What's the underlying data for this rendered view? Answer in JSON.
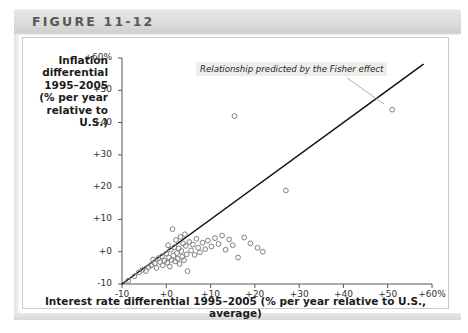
{
  "figure": {
    "label": "FIGURE 11-12"
  },
  "axis": {
    "y_title_lines": [
      "Inflation",
      "differential",
      "1995–2005",
      "(% per year",
      "relative to",
      "U.S.)"
    ],
    "y_title_text": "Inflation differential 1995–2005 (% per year relative to U.S.)",
    "x_title": "Interest rate differential 1995–2005 (% per year relative to U.S., average)"
  },
  "annotation": {
    "text": "Relationship predicted by the Fisher effect"
  },
  "colors": {
    "header_band": "#dcdcda",
    "panel_border": "#c9c9c7",
    "axis": "#555555",
    "line": "#111111",
    "marker_stroke": "#808080",
    "annotation_bg": "#ededeb",
    "text": "#1b1b1b"
  },
  "chart_data": {
    "type": "scatter",
    "title": "",
    "xlabel": "Interest rate differential 1995–2005 (% per year relative to U.S., average)",
    "ylabel": "Inflation differential 1995–2005 (% per year relative to U.S.)",
    "xlim": [
      -10,
      60
    ],
    "ylim": [
      -10,
      60
    ],
    "xticks": [
      -10,
      0,
      10,
      20,
      30,
      40,
      50,
      60
    ],
    "yticks": [
      -10,
      0,
      10,
      20,
      30,
      40,
      50,
      60
    ],
    "xtick_labels": [
      "-10",
      "+0",
      "+10",
      "+20",
      "+30",
      "+40",
      "+50",
      "+60%"
    ],
    "ytick_labels": [
      "-10",
      "+0",
      "+10",
      "+20",
      "+30",
      "+40",
      "+50",
      "+60%"
    ],
    "grid": false,
    "legend": null,
    "annotations": [
      {
        "text": "Relationship predicted by the Fisher effect",
        "x": -4,
        "y": 53,
        "leader_to_x": 18,
        "leader_to_y": 27
      }
    ],
    "series": [
      {
        "name": "Countries",
        "marker": "open-circle",
        "points": [
          [
            -8.6,
            -9.0
          ],
          [
            -7.2,
            -7.6
          ],
          [
            -6.2,
            -6.4
          ],
          [
            -5.4,
            -5.6
          ],
          [
            -4.6,
            -6.0
          ],
          [
            -4.0,
            -4.8
          ],
          [
            -3.4,
            -4.2
          ],
          [
            -3.0,
            -2.4
          ],
          [
            -2.6,
            -3.6
          ],
          [
            -2.2,
            -5.0
          ],
          [
            -1.8,
            -2.0
          ],
          [
            -1.4,
            -3.2
          ],
          [
            -1.0,
            -1.4
          ],
          [
            -0.8,
            -4.2
          ],
          [
            -0.4,
            -2.8
          ],
          [
            0.0,
            -0.6
          ],
          [
            0.2,
            -3.4
          ],
          [
            0.4,
            2.0
          ],
          [
            0.6,
            -1.8
          ],
          [
            0.8,
            -4.6
          ],
          [
            1.0,
            0.6
          ],
          [
            1.2,
            -2.6
          ],
          [
            1.4,
            7.0
          ],
          [
            1.6,
            -1.2
          ],
          [
            1.8,
            1.4
          ],
          [
            2.0,
            -3.0
          ],
          [
            2.2,
            3.6
          ],
          [
            2.4,
            -0.4
          ],
          [
            2.6,
            -2.2
          ],
          [
            2.8,
            1.0
          ],
          [
            3.0,
            -3.8
          ],
          [
            3.2,
            4.6
          ],
          [
            3.4,
            0.2
          ],
          [
            3.6,
            -1.6
          ],
          [
            3.8,
            2.6
          ],
          [
            4.0,
            -2.6
          ],
          [
            4.2,
            5.4
          ],
          [
            4.4,
            1.8
          ],
          [
            4.6,
            -0.8
          ],
          [
            4.8,
            -6.0
          ],
          [
            5.2,
            3.0
          ],
          [
            5.6,
            0.4
          ],
          [
            6.0,
            2.2
          ],
          [
            6.4,
            -1.0
          ],
          [
            6.8,
            4.0
          ],
          [
            7.2,
            1.2
          ],
          [
            7.6,
            -0.2
          ],
          [
            8.2,
            2.8
          ],
          [
            8.8,
            0.8
          ],
          [
            9.4,
            3.4
          ],
          [
            10.2,
            1.6
          ],
          [
            11.0,
            4.2
          ],
          [
            11.8,
            2.4
          ],
          [
            12.6,
            5.0
          ],
          [
            13.4,
            0.6
          ],
          [
            14.2,
            3.8
          ],
          [
            15.0,
            2.0
          ],
          [
            15.4,
            42.0
          ],
          [
            16.2,
            -1.8
          ],
          [
            17.6,
            4.4
          ],
          [
            19.0,
            2.6
          ],
          [
            20.6,
            1.2
          ],
          [
            21.8,
            0.0
          ],
          [
            27.0,
            19.0
          ],
          [
            51.0,
            44.0
          ]
        ]
      }
    ],
    "fit_line": {
      "label": "Relationship predicted by the Fisher effect",
      "from": [
        -10,
        -10
      ],
      "to": [
        58,
        58
      ],
      "slope": 1,
      "intercept": 0
    }
  }
}
